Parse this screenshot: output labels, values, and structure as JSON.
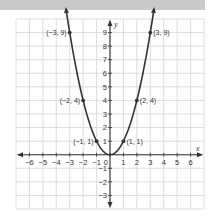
{
  "chart_data": {
    "type": "line",
    "title": "",
    "function": "y = x^2",
    "xlabel": "x",
    "ylabel": "y",
    "xlim": [
      -7,
      7
    ],
    "ylim": [
      -4,
      10
    ],
    "grid": true,
    "legend": null,
    "x_ticks": [
      -6,
      -5,
      -4,
      -3,
      -2,
      -1,
      0,
      1,
      2,
      3,
      4,
      5,
      6
    ],
    "y_ticks": [
      9,
      8,
      7,
      6,
      5,
      4,
      3,
      2,
      1,
      -1,
      -2,
      -3
    ],
    "series": [
      {
        "name": "parabola",
        "x": [
          -3,
          -2,
          -1,
          0,
          1,
          2,
          3
        ],
        "y": [
          9,
          4,
          1,
          0,
          1,
          4,
          9
        ]
      }
    ],
    "labeled_points": [
      {
        "x": -3,
        "y": 9,
        "label": "(−3, 9)"
      },
      {
        "x": -2,
        "y": 4,
        "label": "(−2, 4)"
      },
      {
        "x": -1,
        "y": 1,
        "label": "(−1, 1)"
      },
      {
        "x": 1,
        "y": 1,
        "label": "(1, 1)"
      },
      {
        "x": 2,
        "y": 4,
        "label": "(2, 4)"
      },
      {
        "x": 3,
        "y": 9,
        "label": "(3, 9)"
      }
    ],
    "origin_label": "0",
    "colors": {
      "curve": "#333333",
      "grid": "#d4d4d4",
      "axis": "#333333",
      "banner": "#c9c9c9"
    }
  }
}
